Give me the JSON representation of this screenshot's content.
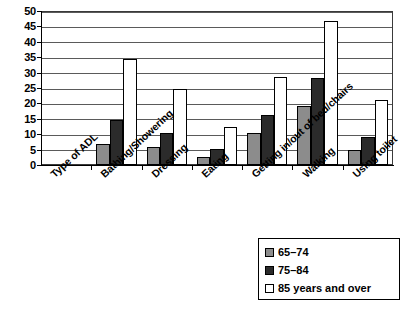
{
  "chart_data": {
    "type": "bar",
    "title": "",
    "xlabel": "Type of ADL",
    "ylabel": "",
    "ylim": [
      0,
      50
    ],
    "ytick_step": 5,
    "yticks": [
      "0",
      "5",
      "10",
      "15",
      "20",
      "25",
      "30",
      "35",
      "40",
      "45",
      "50"
    ],
    "grid": true,
    "legend_position": "bottom-right",
    "axis_title_slot": "Type of ADL",
    "categories": [
      "Bathing/Showering",
      "Dressing",
      "Eating",
      "Getting in/out of bed/chairs",
      "Walking",
      "Using toilet"
    ],
    "all_x_labels": [
      "Type of ADL",
      "Bathing/Showering",
      "Dressing",
      "Eating",
      "Getting in/out of bed/chairs",
      "Walking",
      "Using toilet"
    ],
    "series": [
      {
        "name": "65–74",
        "color": "#8c8c8c",
        "values": [
          6.8,
          5.8,
          2.6,
          10.3,
          19.0,
          4.8
        ]
      },
      {
        "name": "75–84",
        "color": "#2b2b2b",
        "values": [
          14.7,
          10.4,
          5.3,
          16.3,
          28.1,
          9.2
        ]
      },
      {
        "name": "85 years and over",
        "color": "#ffffff",
        "values": [
          34.5,
          24.6,
          12.2,
          28.7,
          46.6,
          21.0
        ]
      }
    ]
  },
  "legend": {
    "entries": [
      {
        "label": "65–74"
      },
      {
        "label": "75–84"
      },
      {
        "label": "85 years and over"
      }
    ]
  },
  "colors": {
    "series_65_74": "#8c8c8c",
    "series_75_84": "#2b2b2b",
    "series_85_over": "#ffffff",
    "axis": "#000000",
    "gridline": "#5a5a5a",
    "background": "#ffffff"
  }
}
